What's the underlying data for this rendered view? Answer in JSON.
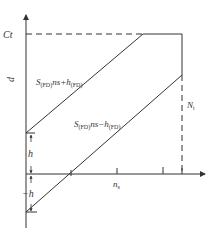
{
  "diagram": {
    "y_axis": {
      "label": "d",
      "top_mark": "Ct"
    },
    "x_axis": {
      "tick_label": "n_s",
      "tick_label_main": "n",
      "tick_label_sub": "s"
    },
    "right_marker": {
      "label_main": "N",
      "label_sub": "t"
    },
    "upper_line": {
      "label_S": "S",
      "label_sub1": "(FD)",
      "label_mid": "ns+h",
      "label_sub2": "(FD)"
    },
    "lower_line": {
      "label_S": "S",
      "label_sub1": "(FD)",
      "label_mid": "ns−h",
      "label_sub2": "(FD)"
    },
    "offsets": {
      "positive": "h",
      "negative": "−h"
    },
    "colors": {
      "line": "#333333",
      "background": "#ffffff"
    }
  }
}
